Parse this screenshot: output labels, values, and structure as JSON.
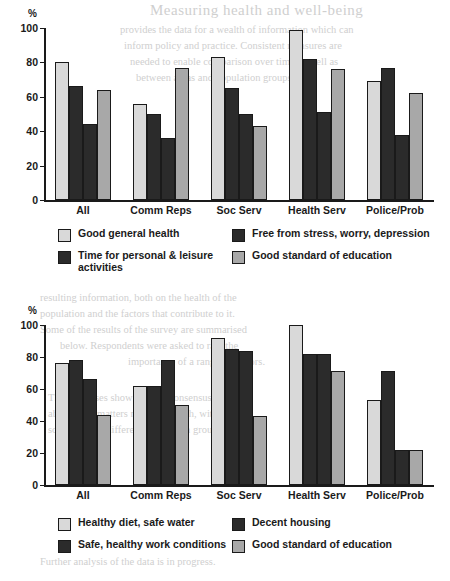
{
  "page": {
    "background": "#ffffff",
    "ghost_text": [
      {
        "text": "Measuring health and well-being",
        "x": 150,
        "y": 2,
        "style": "title"
      },
      {
        "text": "provides the data for a wealth of information which can",
        "x": 120,
        "y": 24,
        "style": "body"
      },
      {
        "text": "inform policy and practice. Consistent measures are",
        "x": 124,
        "y": 40,
        "style": "body"
      },
      {
        "text": "needed to enable comparison over time as well as",
        "x": 130,
        "y": 56,
        "style": "body"
      },
      {
        "text": "between areas and population groups.",
        "x": 136,
        "y": 72,
        "style": "body"
      },
      {
        "text": "resulting information, both on the health of the",
        "x": 40,
        "y": 292,
        "style": "body"
      },
      {
        "text": "population and the factors that contribute to it.",
        "x": 40,
        "y": 308,
        "style": "body"
      },
      {
        "text": "Some of the results of the survey are summarised",
        "x": 40,
        "y": 324,
        "style": "body"
      },
      {
        "text": "below. Respondents were asked to rate the",
        "x": 60,
        "y": 340,
        "style": "body"
      },
      {
        "text": "importance of a range of factors.",
        "x": 128,
        "y": 356,
        "style": "body"
      },
      {
        "text": "The responses show a broad consensus",
        "x": 48,
        "y": 392,
        "style": "body"
      },
      {
        "text": "about what matters most for health, with",
        "x": 48,
        "y": 408,
        "style": "body"
      },
      {
        "text": "some notable differences between groups.",
        "x": 48,
        "y": 424,
        "style": "body"
      },
      {
        "text": "Further analysis of the data is in progress.",
        "x": 40,
        "y": 556,
        "style": "body"
      }
    ]
  },
  "charts": [
    {
      "id": "chart-top",
      "y_axis_label": "%",
      "yticks": [
        0,
        20,
        40,
        60,
        80,
        100
      ],
      "categories": [
        "All",
        "Comm Reps",
        "Soc Serv",
        "Health Serv",
        "Police/Prob"
      ],
      "legend": [
        {
          "label": "Good general health",
          "swatch": "light"
        },
        {
          "label": "Free from stress, worry, depression",
          "swatch": "dark"
        },
        {
          "label": "Time for personal & leisure\nactivities",
          "swatch": "dark"
        },
        {
          "label": "Good standard of education",
          "swatch": "mid"
        }
      ]
    },
    {
      "id": "chart-bottom",
      "y_axis_label": "%",
      "yticks": [
        0,
        20,
        40,
        60,
        80,
        100
      ],
      "categories": [
        "All",
        "Comm Reps",
        "Soc Serv",
        "Health Serv",
        "Police/Prob"
      ],
      "legend": [
        {
          "label": "Healthy diet, safe water",
          "swatch": "light"
        },
        {
          "label": "Decent housing",
          "swatch": "dark"
        },
        {
          "label": "Safe, healthy work conditions",
          "swatch": "dark"
        },
        {
          "label": "Good standard of education",
          "swatch": "mid"
        }
      ]
    }
  ],
  "chart_data": [
    {
      "type": "bar",
      "title": "",
      "xlabel": "",
      "ylabel": "%",
      "ylim": [
        0,
        100
      ],
      "yticks": [
        0,
        20,
        40,
        60,
        80,
        100
      ],
      "grid": false,
      "legend_position": "below",
      "categories": [
        "All",
        "Comm Reps",
        "Soc Serv",
        "Health Serv",
        "Police/Prob"
      ],
      "series": [
        {
          "name": "Good general health",
          "color": "#d9d9d9",
          "values": [
            80,
            56,
            83,
            99,
            69
          ]
        },
        {
          "name": "Free from stress, worry, depression",
          "color": "#2b2b2b",
          "values": [
            66,
            50,
            65,
            82,
            77
          ]
        },
        {
          "name": "Time for personal & leisure activities",
          "color": "#2b2b2b",
          "values": [
            44,
            36,
            50,
            51,
            38
          ]
        },
        {
          "name": "Good standard of education",
          "color": "#a8a8a8",
          "values": [
            64,
            77,
            43,
            76,
            62
          ]
        }
      ]
    },
    {
      "type": "bar",
      "title": "",
      "xlabel": "",
      "ylabel": "%",
      "ylim": [
        0,
        100
      ],
      "yticks": [
        0,
        20,
        40,
        60,
        80,
        100
      ],
      "grid": false,
      "legend_position": "below",
      "categories": [
        "All",
        "Comm Reps",
        "Soc Serv",
        "Health Serv",
        "Police/Prob"
      ],
      "series": [
        {
          "name": "Healthy diet, safe water",
          "color": "#d9d9d9",
          "values": [
            76,
            62,
            92,
            100,
            53
          ]
        },
        {
          "name": "Decent housing",
          "color": "#2b2b2b",
          "values": [
            78,
            62,
            85,
            82,
            71
          ]
        },
        {
          "name": "Safe, healthy work conditions",
          "color": "#2b2b2b",
          "values": [
            66,
            78,
            84,
            82,
            22
          ]
        },
        {
          "name": "Good standard of education",
          "color": "#a8a8a8",
          "values": [
            44,
            50,
            43,
            71,
            22
          ]
        }
      ]
    }
  ]
}
